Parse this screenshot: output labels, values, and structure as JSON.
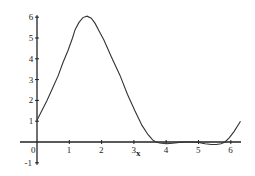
{
  "chart_data": {
    "type": "line",
    "title": "",
    "xlabel": "x",
    "ylabel": "",
    "xlim": [
      0,
      6.3
    ],
    "ylim": [
      -1,
      6
    ],
    "grid": false,
    "legend": null,
    "x_ticks": [
      0,
      1,
      2,
      3,
      4,
      5,
      6
    ],
    "x_tick_labels": [
      "0",
      "1",
      "2",
      "3",
      "4",
      "5",
      "6"
    ],
    "y_ticks": [
      -1,
      1,
      2,
      3,
      4,
      5,
      6
    ],
    "y_tick_labels": [
      "-1",
      "1",
      "2",
      "3",
      "4",
      "5",
      "6"
    ],
    "series": [
      {
        "name": "f(x)",
        "color": "#333333",
        "x": [
          0,
          0.15,
          0.31,
          0.5,
          0.66,
          0.8,
          0.96,
          1.1,
          1.18,
          1.3,
          1.42,
          1.55,
          1.68,
          1.8,
          1.95,
          2.07,
          2.3,
          2.57,
          2.8,
          3.03,
          3.25,
          3.44,
          3.58,
          3.68,
          3.8,
          4.0,
          4.2,
          4.4,
          4.6,
          4.8,
          5.0,
          5.2,
          5.4,
          5.55,
          5.7,
          5.82,
          5.95,
          6.1,
          6.3
        ],
        "y": [
          1.05,
          1.5,
          2.0,
          2.65,
          3.2,
          3.8,
          4.4,
          5.0,
          5.4,
          5.75,
          5.98,
          6.05,
          5.95,
          5.7,
          5.25,
          4.9,
          4.1,
          3.2,
          2.3,
          1.5,
          0.8,
          0.35,
          0.1,
          0.0,
          -0.05,
          -0.08,
          -0.06,
          -0.02,
          0.0,
          0.0,
          -0.02,
          -0.08,
          -0.12,
          -0.12,
          -0.08,
          0.0,
          0.2,
          0.5,
          1.0
        ]
      }
    ]
  }
}
